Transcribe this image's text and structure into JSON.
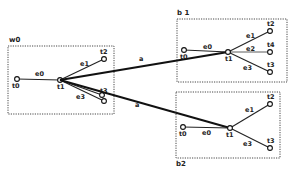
{
  "diagram": {
    "colors": {
      "ink": "#111111",
      "background": "#ffffff"
    },
    "boxes": [
      {
        "id": "w0",
        "label": "w0",
        "nodes": [
          {
            "id": "t0",
            "label": "t0"
          },
          {
            "id": "t1",
            "label": "t1"
          },
          {
            "id": "t2",
            "label": "t2"
          },
          {
            "id": "t3",
            "label": "t3"
          }
        ],
        "edges": [
          {
            "label": "e0",
            "from": "t0",
            "to": "t1"
          },
          {
            "label": "e1",
            "from": "t1",
            "to": "t2"
          },
          {
            "label": "e3",
            "from": "t1",
            "to": "t3"
          }
        ]
      },
      {
        "id": "b1",
        "label": "b 1",
        "nodes": [
          {
            "id": "t0",
            "label": "t0"
          },
          {
            "id": "t1",
            "label": "t1"
          },
          {
            "id": "t2",
            "label": "t2"
          },
          {
            "id": "t4",
            "label": "t4"
          },
          {
            "id": "t3",
            "label": "t3"
          }
        ],
        "edges": [
          {
            "label": "e0",
            "from": "t0",
            "to": "t1"
          },
          {
            "label": "e1",
            "from": "t1",
            "to": "t2"
          },
          {
            "label": "e2",
            "from": "t1",
            "to": "t4"
          },
          {
            "label": "e3",
            "from": "t1",
            "to": "t3"
          }
        ]
      },
      {
        "id": "b2",
        "label": "b2",
        "nodes": [
          {
            "id": "t0",
            "label": "t0"
          },
          {
            "id": "t1",
            "label": "t1"
          },
          {
            "id": "t2",
            "label": "t2"
          },
          {
            "id": "t3",
            "label": "t3"
          }
        ],
        "edges": [
          {
            "label": "e0",
            "from": "t0",
            "to": "t1"
          },
          {
            "label": "e1",
            "from": "t1",
            "to": "t2"
          },
          {
            "label": "e3",
            "from": "t1",
            "to": "t3"
          }
        ]
      }
    ],
    "links": [
      {
        "label": "a",
        "from": "w0.t1",
        "to": "b1.t1"
      },
      {
        "label": "a",
        "from": "w0.t1",
        "to": "b2.t1"
      }
    ]
  }
}
